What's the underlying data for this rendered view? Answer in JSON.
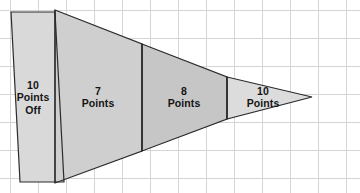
{
  "figure": {
    "type": "wedge-segments-diagram",
    "background_color": "#ffffff",
    "grid": {
      "visible": true,
      "line_color": "#d5d5d5",
      "cell_width": 28,
      "cell_height": 28,
      "origin_x": 10,
      "origin_y": 10,
      "columns": 13,
      "rows": 7
    },
    "outline_color": "#2b2b2b",
    "apex": {
      "x": 312,
      "y": 97
    }
  },
  "segments": [
    {
      "id": "segment-10-points-off",
      "label_lines": [
        "10",
        "Points",
        "Off"
      ],
      "value": 10,
      "unit": "Points",
      "note": "Off",
      "fill_color": "#d9d9d9",
      "label_x": 33,
      "label_y": 79,
      "shape": "parallelogram",
      "points": "11,12 55,12 64,182 20,182"
    },
    {
      "id": "segment-7-points",
      "label_lines": [
        "7",
        "Points"
      ],
      "value": 7,
      "unit": "Points",
      "fill_color": "#cfcfcf",
      "label_x": 98,
      "label_y": 85,
      "shape": "trapezoid",
      "points": "55,10 142,44 142,151 55,183"
    },
    {
      "id": "segment-8-points",
      "label_lines": [
        "8",
        "Points"
      ],
      "value": 8,
      "unit": "Points",
      "fill_color": "#c6c6c6",
      "label_x": 184,
      "label_y": 85,
      "shape": "trapezoid",
      "points": "142,44 227,77 227,119 142,151"
    },
    {
      "id": "segment-10-points",
      "label_lines": [
        "10",
        "Points"
      ],
      "value": 10,
      "unit": "Points",
      "fill_color": "#dcdcdc",
      "label_x": 263,
      "label_y": 85,
      "shape": "triangle",
      "points": "227,77 312,97 227,119"
    }
  ],
  "dividers": [
    {
      "id": "divider-1",
      "x1": 55,
      "y1": 10,
      "x2": 55,
      "y2": 183
    },
    {
      "id": "divider-2",
      "x1": 142,
      "y1": 44,
      "x2": 142,
      "y2": 151
    },
    {
      "id": "divider-3",
      "x1": 227,
      "y1": 77,
      "x2": 227,
      "y2": 119
    }
  ]
}
